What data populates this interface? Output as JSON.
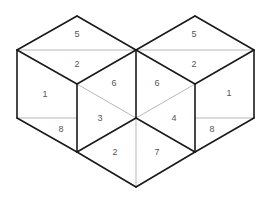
{
  "diagram": {
    "title": "",
    "colors": {
      "thick_line": "#1a1a1a",
      "thin_line": "#9a9a9a",
      "label": "#555555",
      "background": "#ffffff"
    },
    "labels": {
      "left_top_upper": "5",
      "left_top_lower": "2",
      "left_side": "1",
      "left_inner_upper": "6",
      "left_inner_lower": "3",
      "left_bottom_small": "8",
      "bottom_left": "2",
      "right_top_upper": "5",
      "right_top_lower": "2",
      "right_side": "1",
      "right_inner_upper": "6",
      "right_inner_lower": "4",
      "right_bottom_small": "8",
      "bottom_right": "7"
    }
  }
}
